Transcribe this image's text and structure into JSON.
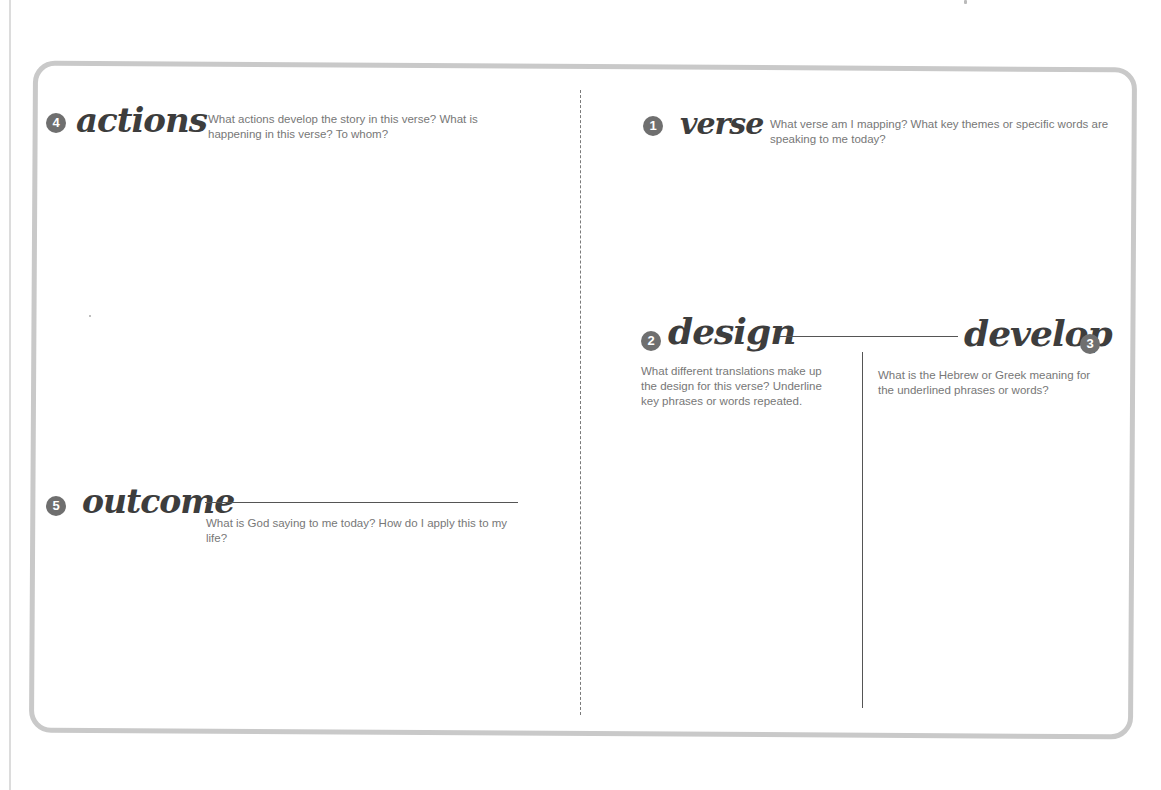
{
  "worksheet": {
    "sections": [
      {
        "number": "1",
        "title": "verse",
        "prompt": "What verse am I mapping? What key themes or specific words are speaking to me today?"
      },
      {
        "number": "2",
        "title": "design",
        "prompt": "What different translations make up the design for this verse? Underline key phrases or words repeated."
      },
      {
        "number": "3",
        "title": "develop",
        "prompt": "What is the Hebrew or Greek meaning for the underlined phrases or words?"
      },
      {
        "number": "4",
        "title": "actions",
        "prompt": "What actions develop the story in this verse? What is happening in this verse? To whom?"
      },
      {
        "number": "5",
        "title": "outcome",
        "prompt": "What is God saying to me today? How do I apply this to my life?"
      }
    ],
    "colors": {
      "border": "#c9c9c9",
      "badge": "#6f6f6f",
      "heading": "#3d3d3d",
      "prompt_text": "#777777",
      "lines": "#555555"
    }
  }
}
